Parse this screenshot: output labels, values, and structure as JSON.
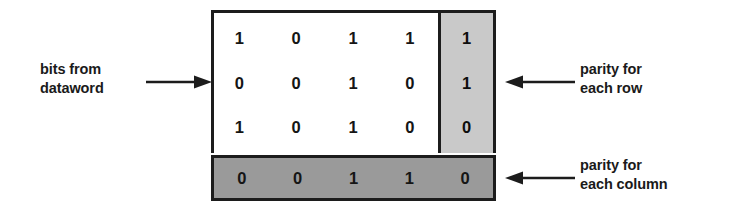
{
  "diagram": {
    "labels": {
      "dataword": "bits from\ndataword",
      "row_parity": "parity for\neach row",
      "column_parity": "parity for\neach column"
    },
    "colors": {
      "background": "#ffffff",
      "data_cells": "#ffffff",
      "row_parity_fill": "#c9c9c9",
      "column_parity_fill": "#9a9a9a",
      "border": "#1c1c1c",
      "text": "#151515"
    }
  },
  "matrix": {
    "data_rows": [
      {
        "bits": [
          "1",
          "0",
          "1",
          "1"
        ],
        "row_parity": "1"
      },
      {
        "bits": [
          "0",
          "0",
          "1",
          "0"
        ],
        "row_parity": "1"
      },
      {
        "bits": [
          "1",
          "0",
          "1",
          "0"
        ],
        "row_parity": "0"
      }
    ],
    "column_parity": [
      "0",
      "0",
      "1",
      "1",
      "0"
    ]
  }
}
